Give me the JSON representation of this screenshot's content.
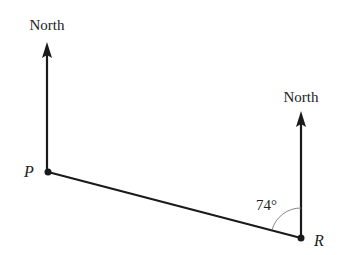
{
  "diagram": {
    "type": "bearing",
    "points": [
      {
        "id": "P",
        "label": "P",
        "x": 48,
        "y": 172
      },
      {
        "id": "R",
        "label": "R",
        "x": 301,
        "y": 238
      }
    ],
    "north_labels": {
      "P": "North",
      "R": "North"
    },
    "angle": {
      "at": "R",
      "value": "74°",
      "between": [
        "North",
        "RP"
      ]
    },
    "segments": [
      {
        "from": "P",
        "to": "R"
      }
    ],
    "colors": {
      "line": "#1a1a1a",
      "arc": "#888888",
      "text": "#222222"
    }
  }
}
